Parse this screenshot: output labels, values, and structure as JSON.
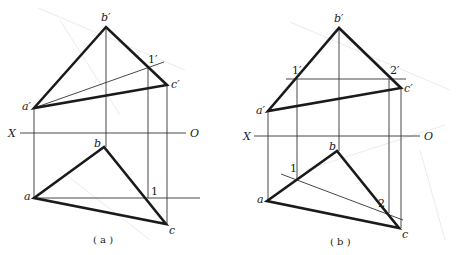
{
  "diagrams": [
    {
      "id": "a",
      "caption": "( a )",
      "axis": {
        "left_label": "X",
        "right_label": "O"
      },
      "elevation_labels": {
        "a": "a′",
        "b": "b′",
        "c": "c′",
        "p1": "1′"
      },
      "plan_labels": {
        "a": "a",
        "b": "b",
        "c": "c",
        "p1": "1"
      }
    },
    {
      "id": "b",
      "caption": "( b )",
      "axis": {
        "left_label": "X",
        "right_label": "O"
      },
      "elevation_labels": {
        "a": "a′",
        "b": "b′",
        "c": "c′",
        "p1": "1′",
        "p2": "2′"
      },
      "plan_labels": {
        "a": "a",
        "b": "b",
        "c": "c",
        "p1": "1",
        "p2": "2"
      }
    }
  ],
  "colors": {
    "line": "#1a1a1a",
    "background": "#ffffff"
  }
}
